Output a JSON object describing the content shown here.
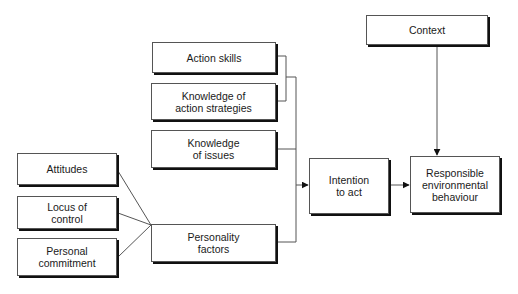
{
  "diagram": {
    "nodes": [
      {
        "id": "action-skills",
        "label": "Action skills",
        "x": 152,
        "y": 42,
        "w": 124,
        "h": 31
      },
      {
        "id": "knowledge-action-strategies",
        "label": "Knowledge of\naction strategies",
        "x": 151,
        "y": 83,
        "w": 125,
        "h": 37
      },
      {
        "id": "knowledge-issues",
        "label": "Knowledge\nof issues",
        "x": 151,
        "y": 130,
        "w": 125,
        "h": 38
      },
      {
        "id": "personality-factors",
        "label": "Personality\nfactors",
        "x": 151,
        "y": 224,
        "w": 125,
        "h": 38
      },
      {
        "id": "attitudes",
        "label": "Attitudes",
        "x": 17,
        "y": 153,
        "w": 100,
        "h": 32
      },
      {
        "id": "locus-of-control",
        "label": "Locus of\ncontrol",
        "x": 17,
        "y": 196,
        "w": 100,
        "h": 33
      },
      {
        "id": "personal-commitment",
        "label": "Personal\ncommitment",
        "x": 17,
        "y": 238,
        "w": 100,
        "h": 38
      },
      {
        "id": "intention-to-act",
        "label": "Intention\nto act",
        "x": 309,
        "y": 158,
        "w": 80,
        "h": 56
      },
      {
        "id": "responsible-environmental-behaviour",
        "label": "Responsible\nenvironmental\nbehaviour",
        "x": 410,
        "y": 156,
        "w": 90,
        "h": 57
      },
      {
        "id": "context",
        "label": "Context",
        "x": 366,
        "y": 15,
        "w": 122,
        "h": 30
      }
    ],
    "edges": [
      {
        "from": "action-skills",
        "to": "intention-to-act"
      },
      {
        "from": "knowledge-action-strategies",
        "to": "intention-to-act"
      },
      {
        "from": "knowledge-issues",
        "to": "intention-to-act"
      },
      {
        "from": "personality-factors",
        "to": "intention-to-act"
      },
      {
        "from": "attitudes",
        "to": "personality-factors"
      },
      {
        "from": "locus-of-control",
        "to": "personality-factors"
      },
      {
        "from": "personal-commitment",
        "to": "personality-factors"
      },
      {
        "from": "intention-to-act",
        "to": "responsible-environmental-behaviour"
      },
      {
        "from": "context",
        "to": "responsible-environmental-behaviour"
      }
    ],
    "colors": {
      "line": "#555555",
      "shadow": "#111111",
      "text": "#1a1a1a"
    }
  }
}
